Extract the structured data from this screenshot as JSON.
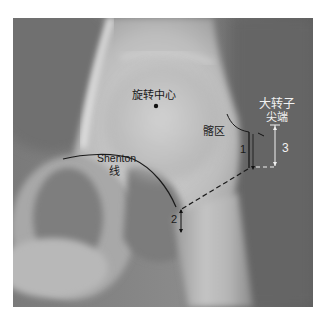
{
  "figure": {
    "type": "hip-radiograph",
    "labels": {
      "rotation_center": "旋转中心",
      "shenton_line_en": "Shenton",
      "shenton_line_cn": "线",
      "region": "髂区",
      "greater_trochanter_line1": "大转子",
      "greater_trochanter_line2": "尖端",
      "measure_1": "1",
      "measure_2": "2",
      "measure_3": "3"
    },
    "colors": {
      "annotation_dark": "#1a1a1a",
      "annotation_light": "#f2f2f2",
      "bone_light": "#d9d9d9",
      "soft_tissue": "#7d7d7d",
      "border": "#ffffff"
    }
  }
}
